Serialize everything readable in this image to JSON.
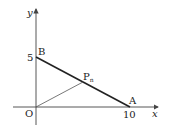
{
  "diagram": {
    "type": "coordinate-geometry",
    "axes": {
      "x_label": "x",
      "y_label": "y",
      "origin_label": "O"
    },
    "points": [
      {
        "name": "A",
        "label": "A",
        "x": 10,
        "y": 0
      },
      {
        "name": "B",
        "label": "B",
        "x": 0,
        "y": 5
      },
      {
        "name": "Pn",
        "label": "P",
        "subscript": "n",
        "x": 5,
        "y": 2.5
      }
    ],
    "tick_labels": {
      "x": "10",
      "y": "5"
    },
    "segments": [
      {
        "from": "B",
        "to": "A",
        "style": "thick"
      },
      {
        "from": "O",
        "to": "Pn",
        "style": "thin"
      }
    ],
    "colors": {
      "line": "#222222",
      "thin_line": "#555555",
      "axis": "#444444"
    }
  }
}
